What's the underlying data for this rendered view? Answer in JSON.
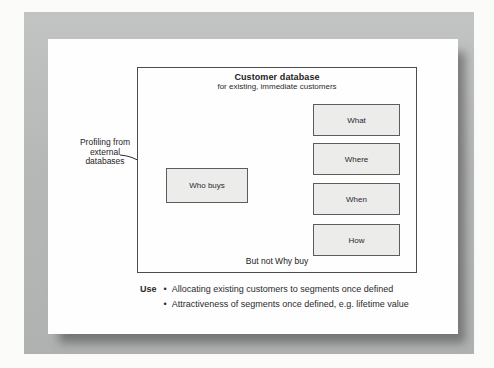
{
  "figure": {
    "diagram": {
      "title": "Customer database",
      "subtitle": "for existing, immediate customers",
      "boxes": [
        {
          "label": "What"
        },
        {
          "label": "Where"
        },
        {
          "label": "When"
        },
        {
          "label": "How"
        }
      ],
      "who_box": {
        "label": "Who buys"
      },
      "footnote": "But not Why buy"
    },
    "annotation": {
      "lines": [
        "Profiling from",
        "external",
        "databases"
      ]
    },
    "use_section": {
      "heading": "Use",
      "bullet_icon": "•",
      "bullets": [
        "Allocating existing customers to segments once defined",
        "Attractiveness of segments once defined, e.g. lifetime value"
      ]
    },
    "colors": {
      "frame": "#b7b9b8",
      "page": "#fefefe",
      "box_fill": "#ececea",
      "box_border": "#5c5c5c",
      "panel_border": "#4d4d4d",
      "text": "#2a2a2a"
    }
  }
}
